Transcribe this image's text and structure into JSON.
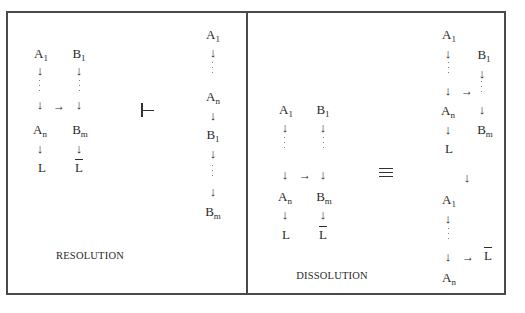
{
  "resolution": {
    "title": "RESOLUTION",
    "left_column_a": [
      "A",
      "1",
      "A",
      "n",
      "L"
    ],
    "left_column_b": [
      "B",
      "1",
      "B",
      "m",
      "L"
    ],
    "operator_symbol": "turnstile",
    "right_chain": [
      "A",
      "1",
      "A",
      "n",
      "B",
      "1",
      "B",
      "m"
    ]
  },
  "dissolution": {
    "title": "DISSOLUTION",
    "left_column_a": [
      "A",
      "1",
      "A",
      "n",
      "L"
    ],
    "left_column_b": [
      "B",
      "1",
      "B",
      "m",
      "L"
    ],
    "operator_symbol": "equivalence",
    "right_top_a": [
      "A",
      "1",
      "A",
      "n",
      "L"
    ],
    "right_top_b": [
      "B",
      "1",
      "B",
      "m"
    ],
    "right_bottom": [
      "A",
      "1",
      "A",
      "n",
      "L"
    ]
  },
  "glyphs": {
    "down_arrow": "↓",
    "right_arrow": "→"
  }
}
